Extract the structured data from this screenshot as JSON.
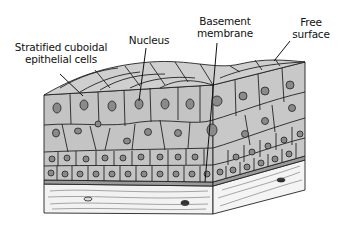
{
  "diagram": {
    "labels": {
      "cells_line1": "Stratified cuboidal",
      "cells_line2": "epithelial cells",
      "nucleus": "Nucleus",
      "basement_line1": "Basement",
      "basement_line2": "membrane",
      "free_line1": "Free",
      "free_line2": "surface"
    },
    "colors": {
      "cell_fill": "#c4c4c4",
      "cell_fill_light": "#d2d2d2",
      "outline": "#222222",
      "nucleus_fill": "#8a8a8a",
      "connective_fill": "#f2f2f2",
      "basement_fill": "#9a9a9a",
      "background": "#ffffff"
    }
  }
}
